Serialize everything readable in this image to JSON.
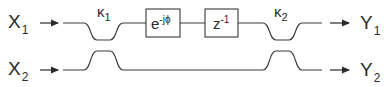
{
  "diagram": {
    "type": "optical coupler / delay-line filter block diagram",
    "inputs": [
      {
        "label": "X",
        "subscript": "1"
      },
      {
        "label": "X",
        "subscript": "2"
      }
    ],
    "outputs": [
      {
        "label": "Y",
        "subscript": "1"
      },
      {
        "label": "Y",
        "subscript": "2"
      }
    ],
    "couplers": [
      {
        "label": "κ",
        "subscript": "1"
      },
      {
        "label": "κ",
        "subscript": "2"
      }
    ],
    "blocks": [
      {
        "base": "e",
        "superscript": "-jϕ"
      },
      {
        "base": "z",
        "superscript": "-1"
      }
    ],
    "line_color": "#3a3a3a"
  }
}
